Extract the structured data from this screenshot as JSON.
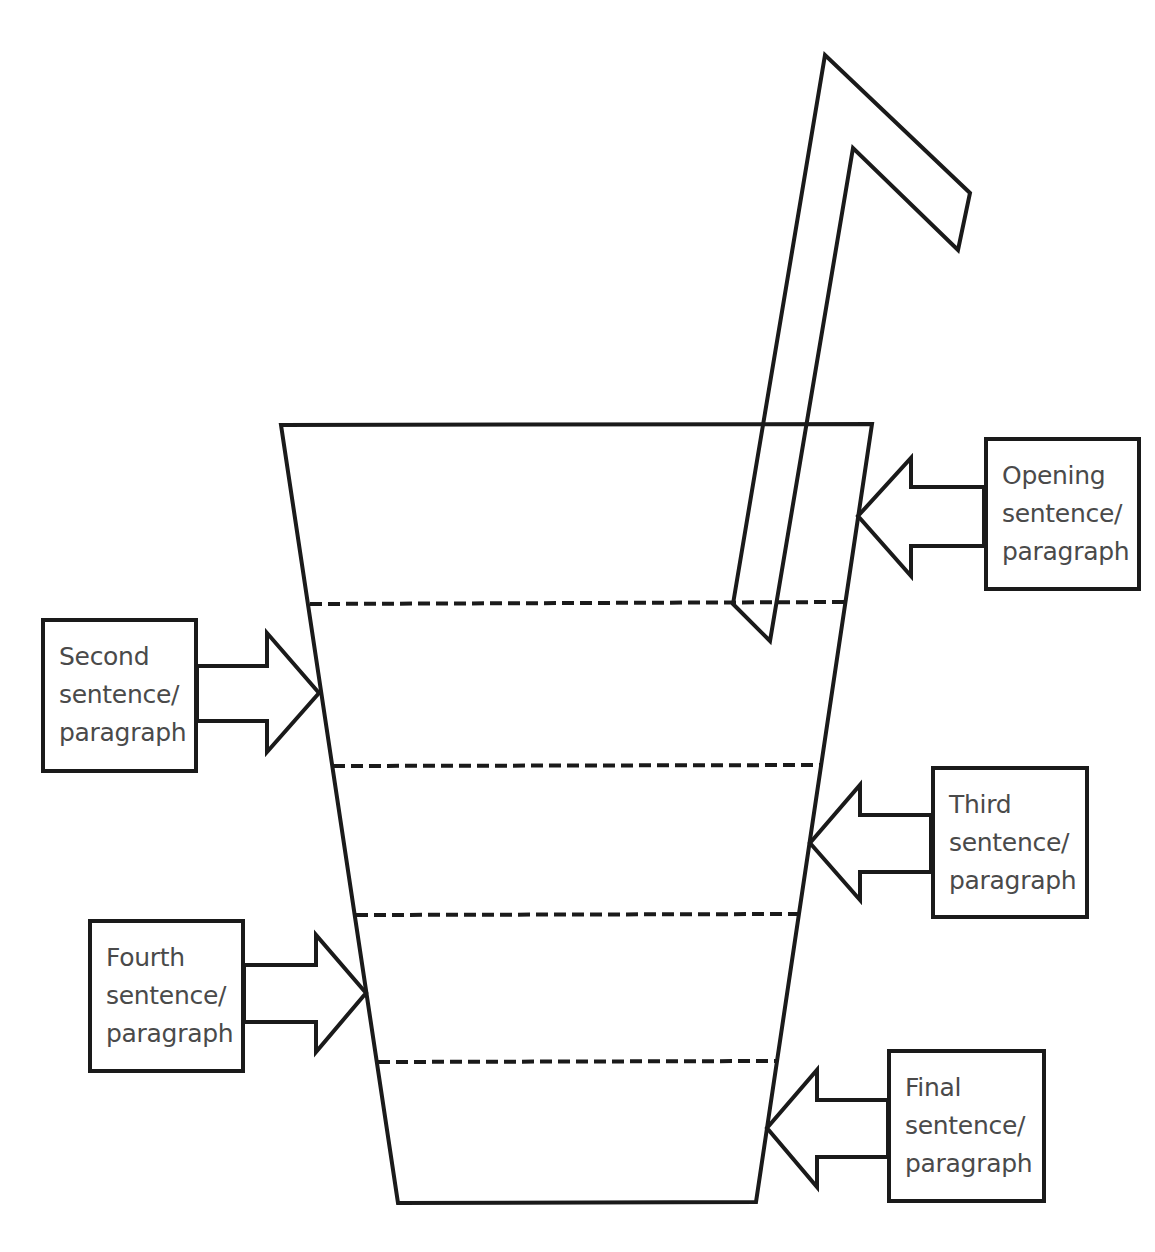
{
  "diagram": {
    "stroke_color": "#1a1a1a",
    "text_color": "#4a4a4a",
    "background_color": "#ffffff",
    "cup": {
      "shape": "trapezoid",
      "sections": 5,
      "divider_style": "dashed"
    },
    "straw": {
      "shape": "bent-straw"
    },
    "labels": [
      {
        "id": "opening",
        "line1": "Opening",
        "line2": "sentence/",
        "line3": "paragraph",
        "side": "right",
        "points_to_section": 1
      },
      {
        "id": "second",
        "line1": "Second",
        "line2": "sentence/",
        "line3": "paragraph",
        "side": "left",
        "points_to_section": 2
      },
      {
        "id": "third",
        "line1": "Third",
        "line2": "sentence/",
        "line3": "paragraph",
        "side": "right",
        "points_to_section": 3
      },
      {
        "id": "fourth",
        "line1": "Fourth",
        "line2": "sentence/",
        "line3": "paragraph",
        "side": "left",
        "points_to_section": 4
      },
      {
        "id": "final",
        "line1": "Final",
        "line2": "sentence/",
        "line3": "paragraph",
        "side": "right",
        "points_to_section": 5
      }
    ]
  }
}
